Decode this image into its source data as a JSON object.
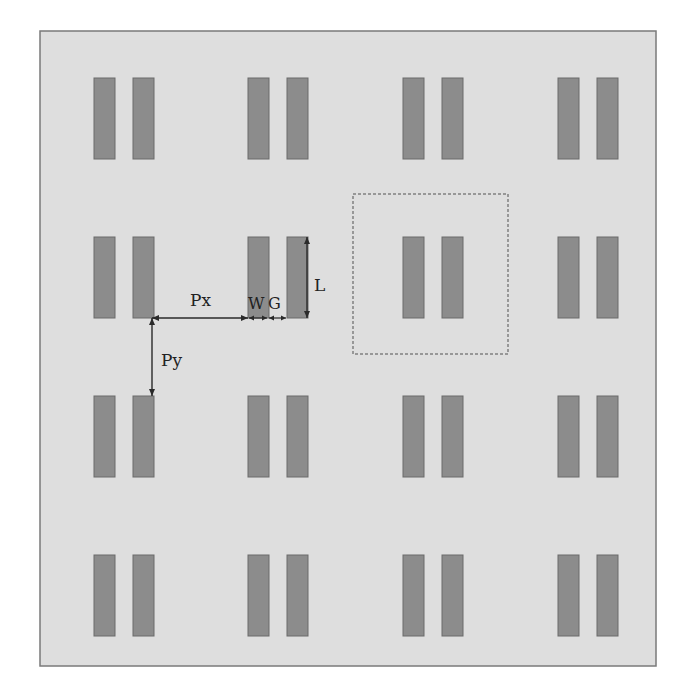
{
  "diagram": {
    "colors": {
      "page": "#ffffff",
      "substrate": "#dedede",
      "substrate_border": "#7a7a7a",
      "strip_fill": "#8c8c8c",
      "strip_stroke": "#6a6a6a",
      "unit_cell_stroke": "#808080",
      "arrow": "#2a2a2a"
    },
    "substrate": {
      "x": 40,
      "y": 31,
      "width": 616,
      "height": 635
    },
    "grid": {
      "columns_x": [
        94,
        248,
        403,
        558
      ],
      "rows_y": [
        78,
        237,
        396,
        555
      ],
      "strip_width": 21,
      "strip_pair_offset": 39,
      "strip_length": 81
    },
    "unit_cell": {
      "x": 353,
      "y": 194,
      "width": 155,
      "height": 160,
      "style": "dashed"
    },
    "labels": {
      "px": "Px",
      "py": "Py",
      "w": "W",
      "g": "G",
      "l": "L"
    },
    "dimensions": {
      "px_arrow": {
        "x1": 152,
        "y1": 318,
        "x2": 248,
        "y2": 318
      },
      "w_arrow": {
        "x1": 248,
        "y1": 318,
        "x2": 268,
        "y2": 318
      },
      "g_arrow": {
        "x1": 268,
        "y1": 318,
        "x2": 287,
        "y2": 318
      },
      "l_arrow": {
        "x1": 307,
        "y1": 237,
        "x2": 307,
        "y2": 318
      },
      "py_arrow": {
        "x1": 152,
        "y1": 318,
        "x2": 152,
        "y2": 396
      }
    }
  }
}
